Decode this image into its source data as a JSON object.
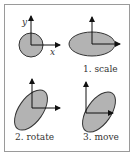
{
  "figure": {
    "panels": [
      {
        "id": "original",
        "label": "",
        "axis_labels": {
          "x": "x",
          "y": "y"
        }
      },
      {
        "id": "scale",
        "label": "1. scale"
      },
      {
        "id": "rotate",
        "label": "2. rotate"
      },
      {
        "id": "move",
        "label": "3. move"
      }
    ]
  },
  "colors": {
    "shape_fill": "#b3b3b3",
    "shape_stroke": "#333333",
    "axis": "#111111",
    "frame": "#9a9a9a"
  }
}
